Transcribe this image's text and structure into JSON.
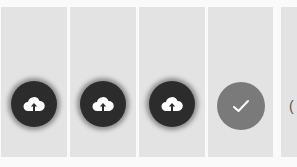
{
  "caption": "",
  "panels": [
    {
      "state": "upload",
      "icon": "cloud-upload-icon"
    },
    {
      "state": "upload",
      "icon": "cloud-upload-icon"
    },
    {
      "state": "upload",
      "icon": "cloud-upload-icon"
    },
    {
      "state": "done",
      "icon": "check-icon"
    },
    {
      "state": "partial",
      "glyph": "("
    }
  ],
  "colors": {
    "panel_bg": "#e3e3e3",
    "upload_button": "#2c2c2c",
    "done_button": "#7a7a7a",
    "icon": "#ffffff"
  },
  "footer": ""
}
